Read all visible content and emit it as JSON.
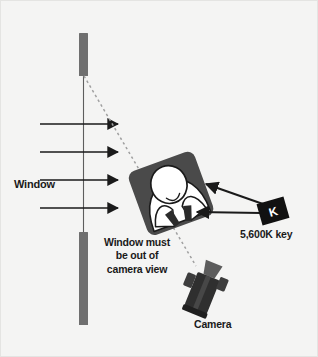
{
  "figure": {
    "background_color": "#f4f4f3",
    "border_color": "#e2e2e0",
    "ink_color": "#1a1a1a",
    "wall_color": "#6f6f6f",
    "desk_color": "#4a4a4a",
    "subject_color": "#ffffff",
    "camera_color": "#3a3a3a",
    "sightline_color": "#9a9a9a"
  },
  "labels": {
    "window": "Window",
    "key_light": "5,600K key",
    "camera": "Camera",
    "key_light_badge": "K"
  },
  "note": {
    "line1": "Window must",
    "line2": "be out of",
    "line3": "camera view"
  },
  "elements": {
    "window_wall_upper": {
      "x": 79,
      "y": 33,
      "width": 9,
      "height": 43
    },
    "window_wall_lower": {
      "x": 79,
      "y": 232,
      "width": 9,
      "height": 93
    },
    "window_glass_line": {
      "x": 83.5,
      "y1": 76,
      "y2": 232
    },
    "light_rays": {
      "count": 4,
      "x_start": 40,
      "x_end": 120,
      "y_values": [
        124,
        152,
        180,
        208
      ]
    },
    "sightline": {
      "x1": 84,
      "y1": 76,
      "x2": 196,
      "y2": 266,
      "style": "dashed"
    },
    "subject": {
      "center_x": 172,
      "center_y": 193
    },
    "key_light_badge_box": {
      "center_x": 273,
      "center_y": 211
    },
    "key_arrows": [
      {
        "from_x": 263,
        "from_y": 204,
        "to_x": 205,
        "to_y": 184
      },
      {
        "from_x": 261,
        "from_y": 213,
        "to_x": 196,
        "to_y": 212
      }
    ],
    "camera": {
      "center_x": 203,
      "center_y": 291
    }
  }
}
